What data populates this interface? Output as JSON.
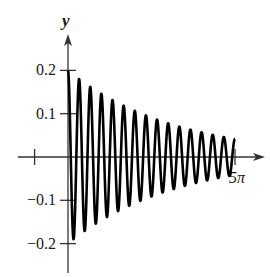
{
  "chart_data": {
    "type": "line",
    "title": "",
    "xlabel": "t",
    "ylabel": "y",
    "function": "y = 0.2 * e^(-t/10) * cos(6t)",
    "amplitude": 0.2,
    "decay_rate": 0.1,
    "angular_frequency": 6,
    "xlim": [
      -1.5,
      5.6
    ],
    "xlim_units": "multiples of pi",
    "ylim": [
      -0.24,
      0.27
    ],
    "x_ticks": [
      {
        "value": -1,
        "label": ""
      },
      {
        "value": 5,
        "label": "5π"
      }
    ],
    "y_ticks": [
      {
        "value": 0.2,
        "label": "0.2"
      },
      {
        "value": 0.1,
        "label": "0.1"
      },
      {
        "value": -0.1,
        "label": "−0.1"
      },
      {
        "value": -0.2,
        "label": "−0.2"
      }
    ],
    "domain": [
      0,
      5
    ],
    "grid": false,
    "legend": "none"
  }
}
